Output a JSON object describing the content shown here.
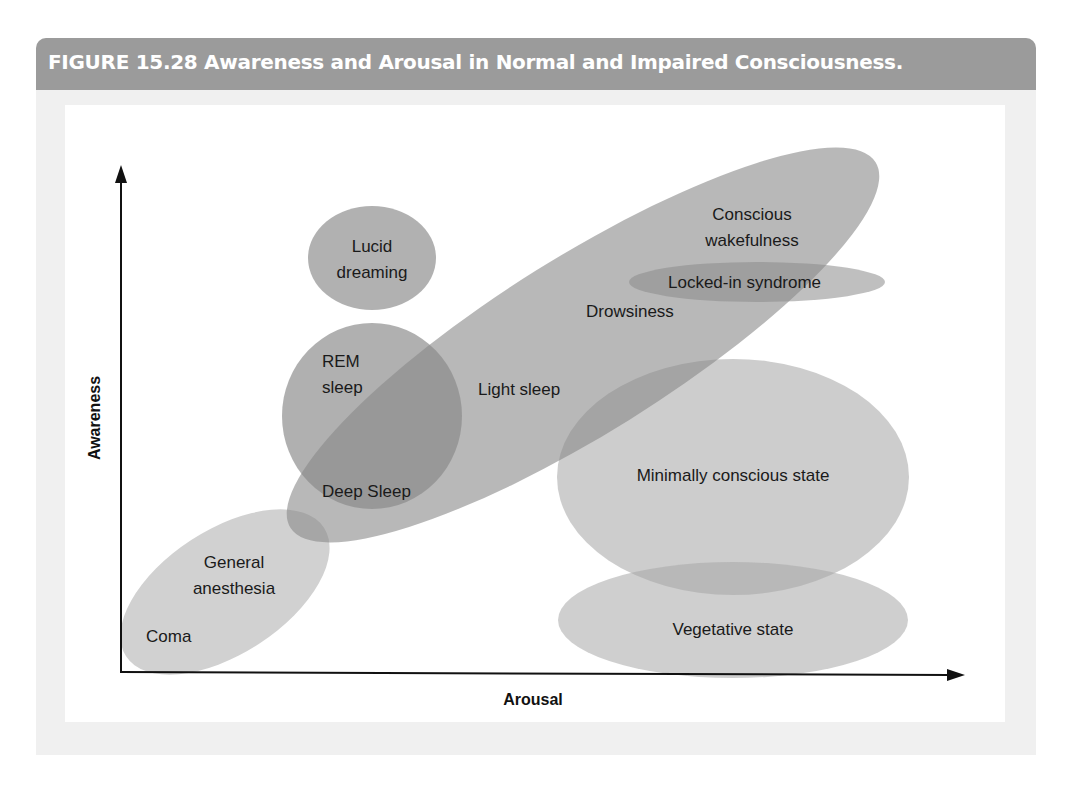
{
  "figure": {
    "title": "FIGURE 15.28  Awareness and Arousal in Normal and Impaired Consciousness.",
    "colors": {
      "header_band": "#9b9b9b",
      "outer_panel": "#f0f0f0",
      "inner_panel": "#ffffff",
      "ellipse_fill": "#8c8c8c",
      "light_ellipse_fill": "#c9c9c9",
      "axis": "#111111"
    }
  },
  "axes": {
    "x_label": "Arousal",
    "y_label": "Awareness"
  },
  "regions": {
    "lucid_dreaming": {
      "line1": "Lucid",
      "line2": "dreaming"
    },
    "rem_sleep": {
      "line1": "REM",
      "line2": "sleep"
    },
    "light_sleep": {
      "label": "Light sleep"
    },
    "deep_sleep": {
      "label": "Deep Sleep"
    },
    "drowsiness": {
      "label": "Drowsiness"
    },
    "conscious_wakefulness": {
      "line1": "Conscious",
      "line2": "wakefulness"
    },
    "locked_in": {
      "label": "Locked-in syndrome"
    },
    "general_anesthesia": {
      "line1": "General",
      "line2": "anesthesia"
    },
    "coma": {
      "label": "Coma"
    },
    "minimally_conscious": {
      "label": "Minimally conscious state"
    },
    "vegetative": {
      "label": "Vegetative state"
    }
  }
}
